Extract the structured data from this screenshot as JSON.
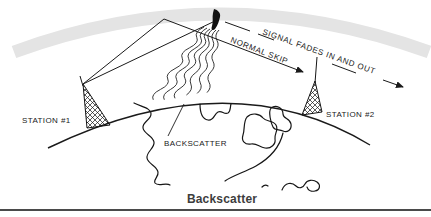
{
  "figure": {
    "caption": "Backscatter",
    "labels": {
      "station1": "STATION #1",
      "station2": "STATION #2",
      "backscatter": "BACKSCATTER",
      "normal_skip": "NORMAL SKIP",
      "signal_fades": "SIGNAL FADES IN AND OUT"
    },
    "colors": {
      "ionosphere_band": "#e4e4e4",
      "ink": "#1a1a1a",
      "caption_text": "#3d3d3d",
      "bottom_rule": "#4a4a4a"
    }
  }
}
